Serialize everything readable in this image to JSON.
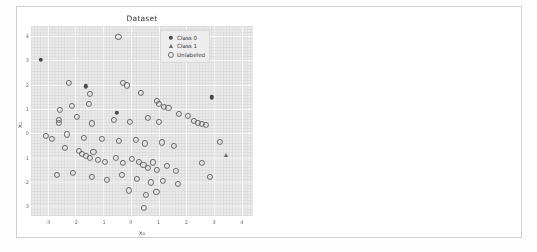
{
  "figure": {
    "width": 537,
    "height": 252,
    "background_color": "#ffffff",
    "axes_background_color": "#e9e9e9",
    "grid_color": "#fbfbfb"
  },
  "chart_data": [
    {
      "type": "scatter",
      "title": "Dataset",
      "xlabel": "x_0",
      "ylabel": "x_1",
      "xlim": [
        -3.6,
        4.4
      ],
      "ylim": [
        -3.4,
        4.4
      ],
      "xticks": [
        -3,
        -2,
        -1,
        0,
        1,
        2,
        3,
        4
      ],
      "yticks": [
        -3,
        -2,
        -1,
        0,
        1,
        2,
        3,
        4
      ],
      "grid": true,
      "legend_position": "upper right",
      "series": [
        {
          "name": "Class 0",
          "marker": "circle-filled",
          "color": "#4a4a4a",
          "points": [
            [
              -3.25,
              3.02
            ],
            [
              -1.62,
              1.93
            ],
            [
              -0.52,
              0.85
            ],
            [
              2.92,
              1.47
            ]
          ]
        },
        {
          "name": "Class 1",
          "marker": "triangle-up",
          "color": "#6a6a6a",
          "points": [
            [
              3.42,
              -0.88
            ]
          ]
        },
        {
          "name": "Unlabeled",
          "marker": "circle-open",
          "color": "#6b6b6b",
          "points": [
            [
              -0.45,
              3.95
            ],
            [
              -2.22,
              2.05
            ],
            [
              -1.48,
              1.62
            ],
            [
              -1.52,
              1.2
            ],
            [
              -0.3,
              2.08
            ],
            [
              -0.14,
              1.96
            ],
            [
              0.35,
              1.66
            ],
            [
              0.95,
              1.32
            ],
            [
              1.02,
              1.22
            ],
            [
              1.18,
              1.08
            ],
            [
              1.35,
              1.02
            ],
            [
              -2.55,
              0.95
            ],
            [
              -2.12,
              1.12
            ],
            [
              -2.6,
              0.55
            ],
            [
              -2.58,
              0.42
            ],
            [
              -1.95,
              0.66
            ],
            [
              -1.4,
              0.4
            ],
            [
              -0.62,
              0.55
            ],
            [
              -0.05,
              0.48
            ],
            [
              0.62,
              0.62
            ],
            [
              1.02,
              0.48
            ],
            [
              1.72,
              0.8
            ],
            [
              2.05,
              0.7
            ],
            [
              2.28,
              0.5
            ],
            [
              2.4,
              0.42
            ],
            [
              2.55,
              0.38
            ],
            [
              2.7,
              0.33
            ],
            [
              -3.05,
              -0.1
            ],
            [
              -2.85,
              -0.25
            ],
            [
              -2.3,
              -0.05
            ],
            [
              -1.7,
              -0.18
            ],
            [
              -1.05,
              -0.22
            ],
            [
              -0.42,
              -0.3
            ],
            [
              0.18,
              -0.28
            ],
            [
              0.52,
              -0.42
            ],
            [
              1.12,
              -0.38
            ],
            [
              1.55,
              -0.52
            ],
            [
              3.22,
              -0.35
            ],
            [
              -2.38,
              -0.62
            ],
            [
              -1.88,
              -0.72
            ],
            [
              -1.78,
              -0.85
            ],
            [
              -1.62,
              -0.95
            ],
            [
              -1.48,
              -1.02
            ],
            [
              -1.35,
              -0.78
            ],
            [
              -1.2,
              -1.1
            ],
            [
              -0.95,
              -1.18
            ],
            [
              -0.55,
              -1.02
            ],
            [
              -0.3,
              -1.22
            ],
            [
              0.02,
              -1.05
            ],
            [
              0.28,
              -1.18
            ],
            [
              0.45,
              -1.32
            ],
            [
              0.62,
              -1.42
            ],
            [
              0.8,
              -1.2
            ],
            [
              0.95,
              -1.52
            ],
            [
              1.3,
              -1.35
            ],
            [
              1.62,
              -1.55
            ],
            [
              2.55,
              -1.22
            ],
            [
              -2.68,
              -1.72
            ],
            [
              -2.1,
              -1.62
            ],
            [
              -1.42,
              -1.78
            ],
            [
              -0.85,
              -1.92
            ],
            [
              -0.32,
              -1.7
            ],
            [
              0.2,
              -1.88
            ],
            [
              0.72,
              -2.02
            ],
            [
              1.15,
              -1.95
            ],
            [
              1.7,
              -2.08
            ],
            [
              2.85,
              -1.78
            ],
            [
              -0.08,
              -2.35
            ],
            [
              0.55,
              -2.55
            ],
            [
              0.92,
              -2.42
            ],
            [
              0.48,
              -3.08
            ]
          ]
        }
      ]
    },
    {
      "type": "scatter",
      "title": "Linear SVM",
      "xlabel": "x_0",
      "ylabel": "x_1",
      "xlim": [
        -3.6,
        4.4
      ],
      "ylim": [
        -3.4,
        4.4
      ],
      "xticks": [
        -3,
        -2,
        -1,
        0,
        1,
        2,
        3,
        4
      ],
      "yticks": [
        -3,
        -2,
        -1,
        0,
        1,
        2,
        3,
        4
      ],
      "grid": true,
      "legend_position": "upper right",
      "series": [
        {
          "name": "Labeled class 0",
          "marker": "circle-filled",
          "color": "#4a4a4a",
          "points": [
            [
              -3.25,
              3.02
            ],
            [
              -1.62,
              1.93
            ],
            [
              -0.52,
              0.85
            ],
            [
              2.92,
              1.47
            ]
          ]
        },
        {
          "name": "Labeled class 1",
          "marker": "triangle-up",
          "color": "#6a6a6a",
          "points": [
            [
              3.42,
              -0.88
            ]
          ]
        },
        {
          "name": "Unlabeled class 0",
          "marker": "square-filled",
          "color": "#5a5a5a",
          "points": [
            [
              -0.45,
              3.95
            ],
            [
              -2.22,
              2.05
            ],
            [
              -1.48,
              1.62
            ],
            [
              -1.52,
              1.2
            ],
            [
              -0.3,
              2.08
            ],
            [
              -0.14,
              1.96
            ],
            [
              0.35,
              1.66
            ],
            [
              0.95,
              1.32
            ],
            [
              1.02,
              1.22
            ],
            [
              1.18,
              1.08
            ],
            [
              1.35,
              1.02
            ],
            [
              -2.55,
              0.95
            ],
            [
              -2.12,
              1.12
            ],
            [
              -2.6,
              0.55
            ],
            [
              -2.58,
              0.42
            ],
            [
              -1.95,
              0.66
            ],
            [
              -1.4,
              0.4
            ],
            [
              -0.62,
              0.55
            ],
            [
              -0.05,
              0.48
            ],
            [
              0.62,
              0.62
            ],
            [
              1.02,
              0.48
            ],
            [
              1.72,
              0.8
            ],
            [
              2.05,
              0.7
            ],
            [
              -3.05,
              -0.1
            ],
            [
              -2.85,
              -0.25
            ],
            [
              -2.3,
              -0.05
            ],
            [
              -1.7,
              -0.18
            ],
            [
              -1.05,
              -0.22
            ],
            [
              -0.42,
              -0.3
            ],
            [
              -2.38,
              -0.62
            ],
            [
              -1.88,
              -0.72
            ],
            [
              -1.78,
              -0.85
            ],
            [
              -1.35,
              -0.78
            ],
            [
              -2.68,
              -1.72
            ]
          ]
        },
        {
          "name": "Unlabeled class 1",
          "marker": "triangle-down",
          "color": "#5a5a5a",
          "points": [
            [
              2.28,
              0.5
            ],
            [
              2.4,
              0.42
            ],
            [
              2.55,
              0.38
            ],
            [
              2.7,
              0.33
            ],
            [
              0.18,
              -0.28
            ],
            [
              0.52,
              -0.42
            ],
            [
              1.12,
              -0.38
            ],
            [
              1.55,
              -0.52
            ],
            [
              3.22,
              -0.35
            ],
            [
              -1.62,
              -0.95
            ],
            [
              -1.48,
              -1.02
            ],
            [
              -1.2,
              -1.1
            ],
            [
              -0.95,
              -1.18
            ],
            [
              -0.55,
              -1.02
            ],
            [
              -0.3,
              -1.22
            ],
            [
              0.02,
              -1.05
            ],
            [
              0.28,
              -1.18
            ],
            [
              0.45,
              -1.32
            ],
            [
              0.62,
              -1.42
            ],
            [
              0.8,
              -1.2
            ],
            [
              0.95,
              -1.52
            ],
            [
              1.3,
              -1.35
            ],
            [
              1.62,
              -1.55
            ],
            [
              2.55,
              -1.22
            ],
            [
              -2.1,
              -1.62
            ],
            [
              -1.42,
              -1.78
            ],
            [
              -0.85,
              -1.92
            ],
            [
              -0.32,
              -1.7
            ],
            [
              0.2,
              -1.88
            ],
            [
              0.72,
              -2.02
            ],
            [
              1.15,
              -1.95
            ],
            [
              1.7,
              -2.08
            ],
            [
              2.85,
              -1.78
            ],
            [
              -0.08,
              -2.35
            ],
            [
              0.55,
              -2.55
            ],
            [
              0.92,
              -2.42
            ],
            [
              0.48,
              -3.08
            ]
          ]
        }
      ]
    }
  ],
  "panels": {
    "left": {
      "title": "Dataset",
      "xlabel": "x₀",
      "ylabel": "x₁",
      "xticks": [
        "-3",
        "-2",
        "-1",
        "0",
        "1",
        "2",
        "3",
        "4"
      ],
      "yticks": [
        "4",
        "3",
        "2",
        "1",
        "0",
        "-1",
        "-2",
        "-3"
      ],
      "legend": [
        {
          "label": "Class 0",
          "marker": "circle-filled"
        },
        {
          "label": "Class 1",
          "marker": "triangle-up"
        },
        {
          "label": "Unlabeled",
          "marker": "circle-open"
        }
      ]
    },
    "right": {
      "title": "Linear SVM",
      "xlabel": "x₀",
      "ylabel": "x₁",
      "xticks": [
        "-3",
        "-2",
        "-1",
        "0",
        "1",
        "2",
        "3",
        "4"
      ],
      "yticks": [
        "4",
        "3",
        "2",
        "1",
        "0",
        "-1",
        "-2",
        "-3"
      ],
      "legend": [
        {
          "label": "Labeled class 0",
          "marker": "circle-filled"
        },
        {
          "label": "Labeled class 1",
          "marker": "triangle-up"
        },
        {
          "label": "Unlabeled class 0",
          "marker": "square-filled"
        },
        {
          "label": "Unlabeled class 1",
          "marker": "triangle-down"
        }
      ]
    }
  }
}
